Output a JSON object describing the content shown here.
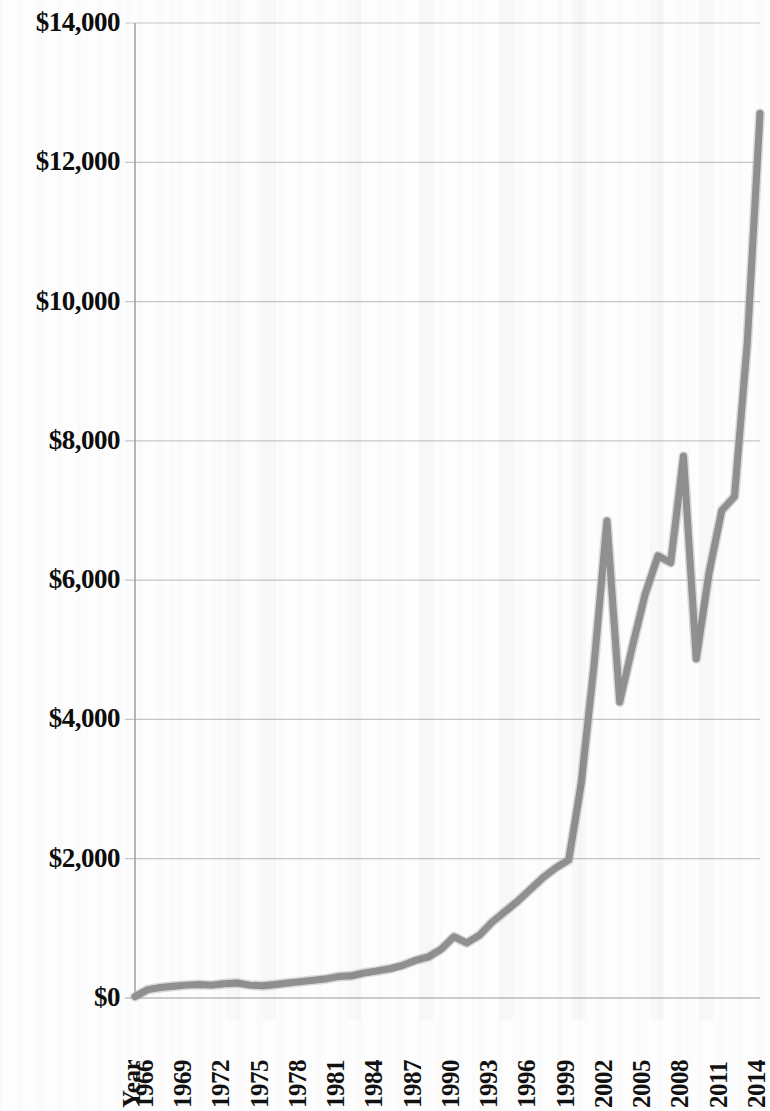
{
  "chart_data": {
    "type": "line",
    "title": "",
    "subtitle": "",
    "xlabel": "Year",
    "ylabel": "",
    "grid": true,
    "legend": false,
    "legend_position": "none",
    "line_color": "#909090",
    "line_width": 7,
    "ylim": [
      0,
      14000
    ],
    "ytick_values": [
      0,
      2000,
      4000,
      6000,
      8000,
      10000,
      12000,
      14000
    ],
    "ytick_labels": [
      "$0",
      "$2,000",
      "$4,000",
      "$6,000",
      "$8,000",
      "$10,000",
      "$12,000",
      "$14,000"
    ],
    "xlim": [
      1965,
      2014
    ],
    "xtick_labels": [
      "Year",
      "1966",
      "1969",
      "1972",
      "1975",
      "1978",
      "1981",
      "1984",
      "1987",
      "1990",
      "1993",
      "1996",
      "1999",
      "2002",
      "2005",
      "2008",
      "2011",
      "2014"
    ],
    "xtick_years": [
      1965,
      1966,
      1969,
      1972,
      1975,
      1978,
      1981,
      1984,
      1987,
      1990,
      1993,
      1996,
      1999,
      2002,
      2005,
      2008,
      2011,
      2014
    ],
    "x": [
      1965,
      1966,
      1967,
      1968,
      1969,
      1970,
      1971,
      1972,
      1973,
      1974,
      1975,
      1976,
      1977,
      1978,
      1979,
      1980,
      1981,
      1982,
      1983,
      1984,
      1985,
      1986,
      1987,
      1988,
      1989,
      1990,
      1991,
      1992,
      1993,
      1994,
      1995,
      1996,
      1997,
      1998,
      1999,
      2000,
      2001,
      2002,
      2003,
      2004,
      2005,
      2006,
      2007,
      2008,
      2009,
      2010,
      2011,
      2012,
      2013,
      2014
    ],
    "values": [
      20,
      120,
      150,
      170,
      185,
      195,
      185,
      205,
      215,
      185,
      175,
      195,
      215,
      235,
      255,
      275,
      310,
      320,
      360,
      390,
      420,
      470,
      540,
      590,
      700,
      880,
      790,
      900,
      1090,
      1240,
      1390,
      1560,
      1730,
      1870,
      1980,
      3100,
      4800,
      6850,
      4250,
      5050,
      5800,
      6350,
      6250,
      7780,
      4870,
      6100,
      7000,
      7200,
      9400,
      12700
    ],
    "series": [
      {
        "name": "Value",
        "values": [
          20,
          120,
          150,
          170,
          185,
          195,
          185,
          205,
          215,
          185,
          175,
          195,
          215,
          235,
          255,
          275,
          310,
          320,
          360,
          390,
          420,
          470,
          540,
          590,
          700,
          880,
          790,
          900,
          1090,
          1240,
          1390,
          1560,
          1730,
          1870,
          1980,
          3100,
          4800,
          6850,
          4250,
          5050,
          5800,
          6350,
          6250,
          7780,
          4870,
          6100,
          7000,
          7200,
          9400,
          12700
        ]
      }
    ],
    "annotations": []
  },
  "axis": {
    "y_title": "",
    "x_title": "Year"
  },
  "colors": {
    "line": "#909090",
    "grid": "#b9b9b9",
    "axis": "#9a9a9a",
    "text": "#111111",
    "background": "#fdfdfd"
  }
}
